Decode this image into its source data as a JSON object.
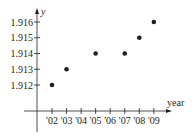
{
  "chart_data": {
    "type": "scatter",
    "title": "",
    "xlabel": "year",
    "ylabel": "y",
    "categories": [
      "'02",
      "'03",
      "'04",
      "'05",
      "'06",
      "'07",
      "'08",
      "'09"
    ],
    "x": [
      "'02",
      "'03",
      "'05",
      "'07",
      "'08",
      "'09"
    ],
    "y": [
      1.912,
      1.913,
      1.914,
      1.914,
      1.915,
      1.916
    ],
    "series": [
      {
        "name": "y",
        "points": [
          {
            "x": "'02",
            "y": 1.912
          },
          {
            "x": "'03",
            "y": 1.913
          },
          {
            "x": "'05",
            "y": 1.914
          },
          {
            "x": "'07",
            "y": 1.914
          },
          {
            "x": "'08",
            "y": 1.915
          },
          {
            "x": "'09",
            "y": 1.916
          }
        ]
      }
    ],
    "y_ticks": [
      1.912,
      1.913,
      1.914,
      1.915,
      1.916
    ],
    "y_tick_labels": [
      "1.912",
      "1.913",
      "1.914",
      "1.915",
      "1.916"
    ],
    "ylim": [
      1.912,
      1.916
    ],
    "grid": false,
    "legend": "none",
    "colors": {
      "ink": "#231f20"
    }
  }
}
